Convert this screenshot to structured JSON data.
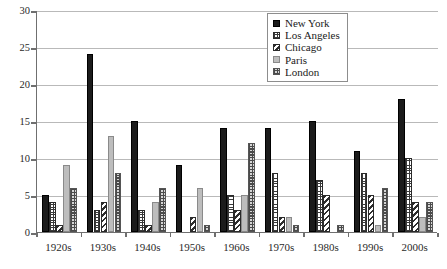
{
  "chart_data": {
    "type": "bar",
    "title": "",
    "subtitle": "",
    "xlabel": "",
    "ylabel": "",
    "ylim": [
      0,
      30
    ],
    "yticks": [
      0,
      5,
      10,
      15,
      20,
      25,
      30
    ],
    "grid": true,
    "legend_position": "top-right-inside",
    "categories": [
      "1920s",
      "1930s",
      "1940s",
      "1950s",
      "1960s",
      "1970s",
      "1980s",
      "1990s",
      "2000s"
    ],
    "series": [
      {
        "name": "New York",
        "pattern": "solid-black",
        "color": "#1b1b1b",
        "values": [
          5,
          24,
          15,
          9,
          14,
          14,
          15,
          11,
          18
        ]
      },
      {
        "name": "Los Angeles",
        "pattern": "fine-grid",
        "color": "#3a3a3a",
        "values": [
          4,
          3,
          3,
          0,
          5,
          8,
          7,
          8,
          10
        ]
      },
      {
        "name": "Chicago",
        "pattern": "diagonal-hatch",
        "color": "#2e2e2e",
        "values": [
          1,
          4,
          1,
          2,
          3,
          2,
          5,
          5,
          4
        ]
      },
      {
        "name": "Paris",
        "pattern": "solid-gray",
        "color": "#bdbdbd",
        "values": [
          9,
          13,
          4,
          6,
          5,
          2,
          0,
          1,
          2
        ]
      },
      {
        "name": "London",
        "pattern": "checkerboard",
        "color": "#4a4a4a",
        "values": [
          6,
          8,
          6,
          1,
          12,
          1,
          1,
          6,
          4
        ]
      }
    ]
  },
  "legend": {
    "items": [
      {
        "label": "New York"
      },
      {
        "label": "Los Angeles"
      },
      {
        "label": "Chicago"
      },
      {
        "label": "Paris"
      },
      {
        "label": "London"
      }
    ]
  },
  "axis": {
    "y_tick_labels": [
      "0",
      "5",
      "10",
      "15",
      "20",
      "25",
      "30"
    ],
    "x_tick_labels": [
      "1920s",
      "1930s",
      "1940s",
      "1950s",
      "1960s",
      "1970s",
      "1980s",
      "1990s",
      "2000s"
    ]
  },
  "colors": {
    "axis": "#6f6f6f",
    "gridline": "#b9b9b9",
    "background": "#ffffff",
    "legend_border": "#8d8d8d"
  }
}
